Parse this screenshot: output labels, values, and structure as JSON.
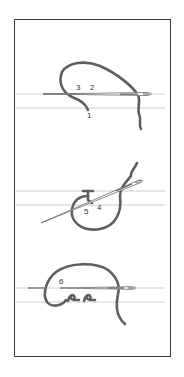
{
  "diagram": {
    "panels": [
      {
        "id": "step-1",
        "labels": [
          "3",
          "2",
          "1"
        ]
      },
      {
        "id": "step-2",
        "labels": [
          "5",
          "4"
        ]
      },
      {
        "id": "step-3",
        "labels": [
          "6"
        ]
      }
    ]
  },
  "labels": {
    "p1_3": "3",
    "p1_2": "2",
    "p1_1": "1",
    "p2_5": "5",
    "p2_4": "4",
    "p3_6": "6"
  },
  "colors": {
    "thread": "#5e5e5e",
    "guide": "#c4c4c4",
    "frame": "#3a3a3a",
    "needle": "#6a6a6a"
  }
}
